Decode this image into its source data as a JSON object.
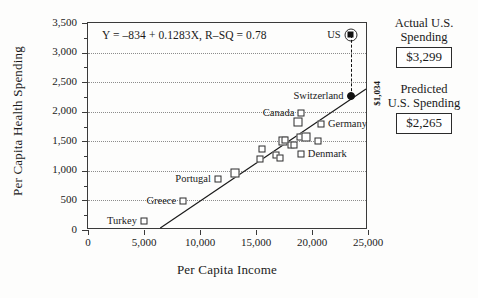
{
  "chart_data": {
    "type": "scatter",
    "title": "",
    "xlabel": "Per Capita Income",
    "ylabel": "Per Capita Health Spending",
    "xlim": [
      0,
      25000
    ],
    "ylim": [
      0,
      3500
    ],
    "xticks": [
      "0",
      "5,000",
      "10,000",
      "15,000",
      "20,000",
      "25,000"
    ],
    "xtick_values": [
      0,
      5000,
      10000,
      15000,
      20000,
      25000
    ],
    "yticks": [
      "0",
      "500",
      "1,000",
      "1,500",
      "2,000",
      "2,500",
      "3,000",
      "3,500"
    ],
    "ytick_values": [
      0,
      500,
      1000,
      1500,
      2000,
      2500,
      3000,
      3500
    ],
    "grid": true,
    "grid_axis": "y",
    "legend": "none",
    "equation": "Y = –834 + 0.1283X,   R–SQ = 0.78",
    "regression": {
      "intercept": -834,
      "slope": 0.1283,
      "r_squared": 0.78
    },
    "points": [
      {
        "label": "Turkey",
        "label_side": "left",
        "x": 5000,
        "y": 150,
        "marker": "square"
      },
      {
        "label": "Greece",
        "label_side": "left",
        "x": 8500,
        "y": 490,
        "marker": "square"
      },
      {
        "label": "Portugal",
        "label_side": "left",
        "x": 11600,
        "y": 855,
        "marker": "square"
      },
      {
        "label": "",
        "label_side": "",
        "x": 13100,
        "y": 965,
        "marker": "square-big"
      },
      {
        "label": "",
        "label_side": "",
        "x": 15400,
        "y": 1195,
        "marker": "square"
      },
      {
        "label": "",
        "label_side": "",
        "x": 15500,
        "y": 1370,
        "marker": "square"
      },
      {
        "label": "",
        "label_side": "",
        "x": 16800,
        "y": 1260,
        "marker": "square"
      },
      {
        "label": "",
        "label_side": "",
        "x": 17100,
        "y": 1225,
        "marker": "square"
      },
      {
        "label": "",
        "label_side": "",
        "x": 17450,
        "y": 1510,
        "marker": "square-big"
      },
      {
        "label": "",
        "label_side": "",
        "x": 17600,
        "y": 1525,
        "marker": "square"
      },
      {
        "label": "",
        "label_side": "",
        "x": 18100,
        "y": 1430,
        "marker": "square"
      },
      {
        "label": "",
        "label_side": "",
        "x": 18350,
        "y": 1440,
        "marker": "square"
      },
      {
        "label": "",
        "label_side": "",
        "x": 18750,
        "y": 1830,
        "marker": "square-big"
      },
      {
        "label": "",
        "label_side": "",
        "x": 18900,
        "y": 1570,
        "marker": "square"
      },
      {
        "label": "Canada",
        "label_side": "left",
        "x": 19050,
        "y": 1975,
        "marker": "square"
      },
      {
        "label": "Denmark",
        "label_side": "right",
        "x": 19000,
        "y": 1290,
        "marker": "square"
      },
      {
        "label": "",
        "label_side": "",
        "x": 19450,
        "y": 1580,
        "marker": "square-big"
      },
      {
        "label": "",
        "label_side": "",
        "x": 20500,
        "y": 1500,
        "marker": "square"
      },
      {
        "label": "Germany",
        "label_side": "right",
        "x": 20800,
        "y": 1790,
        "marker": "square"
      },
      {
        "label": "Switzerland",
        "label_side": "left",
        "x": 23450,
        "y": 2265,
        "marker": "filled-circle"
      },
      {
        "label": "US",
        "label_side": "left",
        "x": 23450,
        "y": 3299,
        "marker": "circled-square"
      }
    ],
    "annotations": [
      {
        "name": "gap-label",
        "text": "$1,034",
        "x": 23450,
        "y_from": 2265,
        "y_to": 3299
      }
    ]
  },
  "side_panel": {
    "actual": {
      "caption_line1": "Actual U.S.",
      "caption_line2": "Spending",
      "value": "$3,299"
    },
    "predicted": {
      "caption_line1": "Predicted",
      "caption_line2": "U.S. Spending",
      "value": "$2,265"
    }
  }
}
